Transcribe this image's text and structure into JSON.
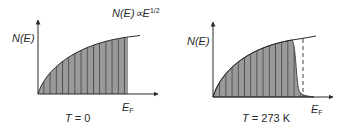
{
  "formula": {
    "base": "N(E)∝E",
    "exponent": "1/2"
  },
  "colors": {
    "fill": "#9a9a9a",
    "stroke": "#2a2a2a",
    "hatch": "#3a3a3a"
  },
  "panels": [
    {
      "y_label": "N(E)",
      "x_label_main": "E",
      "x_label_sub": "F",
      "temperature_label_var": "T",
      "temperature_label_val": " = 0"
    },
    {
      "y_label": "N(E)",
      "x_label_main": "E",
      "x_label_sub": "F",
      "temperature_label_var": "T",
      "temperature_label_val": " = 273 K"
    }
  ]
}
